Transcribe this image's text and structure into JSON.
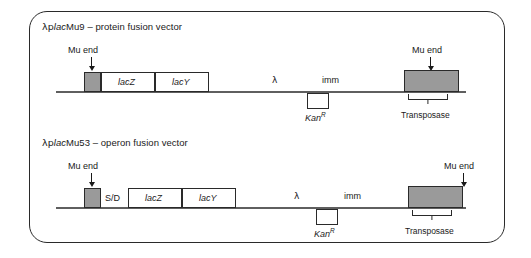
{
  "figure": {
    "frame": "rounded-rectangle-border"
  },
  "panels": [
    {
      "id": "placMu9",
      "title_prefix": "λp",
      "title_italic": "lac",
      "title_suffix": "Mu9 – protein fusion vector",
      "title_full": "λplacMu9 – protein fusion vector",
      "left_mu_end_label": "Mu end",
      "right_mu_end_label": "Mu end",
      "boxes": [
        {
          "name": "mu-end-left",
          "label": "",
          "fill": "#9a9a9a"
        },
        {
          "name": "lacZ",
          "label": "lacZ",
          "fill": "#ffffff"
        },
        {
          "name": "lacY",
          "label": "lacY",
          "fill": "#ffffff"
        },
        {
          "name": "kanR",
          "label": "",
          "fill": "#ffffff"
        },
        {
          "name": "transposase-mu-end-right",
          "label": "",
          "fill": "#9a9a9a"
        }
      ],
      "lambda_label": "λ",
      "imm_label": "imm",
      "kan_label": "Kan",
      "kan_superscript": "R",
      "transposase_label": "Transposase"
    },
    {
      "id": "placMu53",
      "title_prefix": "λp",
      "title_italic": "lac",
      "title_suffix": "Mu53 – operon fusion vector",
      "title_full": "λplacMu53 – operon fusion vector",
      "left_mu_end_label": "Mu end",
      "right_mu_end_label": "Mu end",
      "boxes": [
        {
          "name": "mu-end-left",
          "label": "",
          "fill": "#9a9a9a"
        },
        {
          "name": "shine-dalgarno",
          "label": "S/D",
          "fill": "#ffffff"
        },
        {
          "name": "lacZ",
          "label": "lacZ",
          "fill": "#ffffff"
        },
        {
          "name": "lacY",
          "label": "lacY",
          "fill": "#ffffff"
        },
        {
          "name": "kanR",
          "label": "",
          "fill": "#ffffff"
        },
        {
          "name": "transposase-mu-end-right",
          "label": "",
          "fill": "#9a9a9a"
        }
      ],
      "sd_label": "S/D",
      "lambda_label": "λ",
      "imm_label": "imm",
      "kan_label": "Kan",
      "kan_superscript": "R",
      "transposase_label": "Transposase"
    }
  ],
  "colors": {
    "mu_end_fill": "#9a9a9a",
    "box_stroke": "#2a2a2a",
    "backbone": "#5f5f5f",
    "frame_stroke": "#2a2a2a",
    "background": "#ffffff"
  }
}
